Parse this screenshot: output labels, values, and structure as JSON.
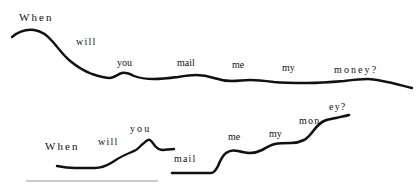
{
  "figure": {
    "title": "",
    "sentence": "When will you mail me my money?",
    "line_color": "#111111",
    "rule_color": "#9a9a9a",
    "background_color": "#ffffff",
    "contours": [
      {
        "id": "contour-top",
        "label": "falling declarative contour",
        "words": [
          {
            "text": "When",
            "x": 19,
            "y": 12,
            "size": 11,
            "spacing": "wide"
          },
          {
            "text": "will",
            "x": 76,
            "y": 37,
            "size": 10,
            "spacing": "mid"
          },
          {
            "text": "you",
            "x": 117,
            "y": 58,
            "size": 10,
            "spacing": "none"
          },
          {
            "text": "mail",
            "x": 177,
            "y": 58,
            "size": 10,
            "spacing": "none"
          },
          {
            "text": "me",
            "x": 232,
            "y": 60,
            "size": 10,
            "spacing": "none"
          },
          {
            "text": "my",
            "x": 282,
            "y": 63,
            "size": 10,
            "spacing": "none"
          },
          {
            "text": "money?",
            "x": 334,
            "y": 65,
            "size": 10,
            "spacing": "wide"
          }
        ],
        "path": "M 12 37 C 18 32, 26 29, 34 30 C 42 31, 48 36, 53 42 C 58 48, 63 55, 69 60 C 76 66, 84 71, 92 74 C 98 76, 104 78, 110 78 C 114 78, 118 74, 122 73 C 126 72, 130 74, 134 76 C 139 78, 146 79, 154 79 C 162 79, 170 78, 178 77 C 184 76, 190 75, 196 75 C 202 75, 208 76, 214 78 C 220 80, 226 81, 232 81 C 238 81, 244 80, 250 80 C 258 80, 266 81, 274 82 C 284 83, 296 83, 308 83 C 320 83, 332 82, 344 81 C 352 80, 360 79, 368 79 C 378 79, 392 83, 412 88",
        "stroke_width": 2.4
      },
      {
        "id": "contour-bottom-left",
        "label": "rising question contour, first half",
        "words": [
          {
            "text": "When",
            "x": 45,
            "y": 141,
            "size": 11,
            "spacing": "wide"
          },
          {
            "text": "will",
            "x": 98,
            "y": 137,
            "size": 10,
            "spacing": "mid"
          },
          {
            "text": "you",
            "x": 130,
            "y": 124,
            "size": 10,
            "spacing": "wide"
          }
        ],
        "path": "M 57 166 C 62 167, 68 168, 75 168 C 82 168, 89 168, 95 168 C 101 168, 106 166, 111 163 C 116 160, 120 157, 125 155 C 129 153, 132 152, 136 150 C 139 148, 141 145, 144 143 C 146 141, 148 139, 150 140 C 152 141, 154 145, 156 147 C 158 149, 160 150, 163 150 C 166 150, 170 149, 174 149",
        "stroke_width": 2.4
      },
      {
        "id": "contour-bottom-right",
        "label": "rising question contour, second half",
        "words": [
          {
            "text": "mail",
            "x": 174,
            "y": 154,
            "size": 10,
            "spacing": "mid"
          },
          {
            "text": "me",
            "x": 228,
            "y": 132,
            "size": 10,
            "spacing": "none"
          },
          {
            "text": "my",
            "x": 269,
            "y": 129,
            "size": 10,
            "spacing": "none"
          },
          {
            "text": "mon",
            "x": 299,
            "y": 116,
            "size": 10,
            "spacing": "mid"
          },
          {
            "text": "ey?",
            "x": 329,
            "y": 102,
            "size": 10,
            "spacing": "mid"
          }
        ],
        "path": "M 172 173 C 178 173, 186 173, 194 173 C 200 173, 206 173, 211 173 C 214 173, 216 170, 218 166 C 220 161, 222 156, 226 153 C 230 150, 234 150, 238 151 C 242 152, 246 153, 250 153 C 254 153, 258 152, 262 150 C 266 148, 270 145, 275 144 C 280 143, 286 143, 291 143 C 296 143, 300 142, 304 140 C 308 138, 311 134, 314 130 C 317 126, 320 123, 324 121 C 328 119, 332 119, 336 118 C 340 117, 345 116, 349 115",
        "stroke_width": 2.6
      }
    ],
    "rule": {
      "id": "baseline-rule",
      "x1": 26,
      "y1": 181,
      "x2": 158,
      "y2": 181
    }
  }
}
